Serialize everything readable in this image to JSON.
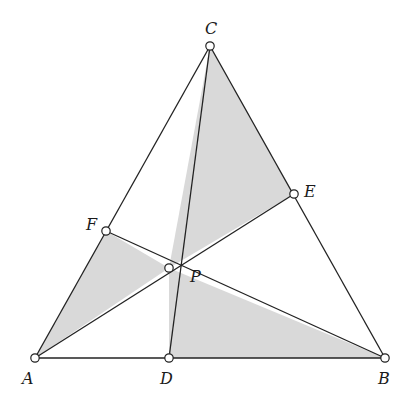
{
  "diagram": {
    "colors": {
      "fill": "#d9d9d9",
      "stroke": "#222222",
      "point_fill": "#ffffff"
    },
    "points": {
      "A": {
        "x": 35,
        "y": 358,
        "label": "A",
        "lx": 22,
        "ly": 384
      },
      "B": {
        "x": 385,
        "y": 358,
        "label": "B",
        "lx": 378,
        "ly": 384
      },
      "C": {
        "x": 210,
        "y": 46,
        "label": "C",
        "lx": 205,
        "ly": 34
      },
      "D": {
        "x": 169,
        "y": 358,
        "label": "D",
        "lx": 160,
        "ly": 384
      },
      "E": {
        "x": 294,
        "y": 194,
        "label": "E",
        "lx": 304,
        "ly": 197
      },
      "F": {
        "x": 106,
        "y": 231,
        "label": "F",
        "lx": 86,
        "ly": 230
      },
      "P": {
        "x": 169,
        "y": 268,
        "label": "P",
        "lx": 190,
        "ly": 282
      }
    },
    "shaded_triangles": [
      [
        "A",
        "F",
        "P"
      ],
      [
        "C",
        "P",
        "E"
      ],
      [
        "P",
        "D",
        "B"
      ]
    ],
    "segments": [
      [
        "A",
        "B"
      ],
      [
        "B",
        "C"
      ],
      [
        "C",
        "A"
      ],
      [
        "A",
        "E"
      ],
      [
        "F",
        "B"
      ],
      [
        "C",
        "D"
      ]
    ]
  }
}
